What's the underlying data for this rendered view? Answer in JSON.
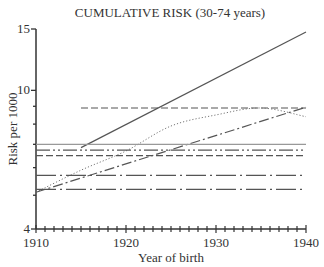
{
  "chart_data": {
    "type": "line",
    "title": "CUMULATIVE RISK (30-74 years)",
    "xlabel": "Year of birth",
    "ylabel": "Risk per 1000",
    "xlim": [
      1910,
      1940
    ],
    "ylim": [
      4,
      15
    ],
    "yscale": "log",
    "x_ticks": [
      1910,
      1920,
      1930,
      1940
    ],
    "y_ticks": [
      4,
      10,
      15
    ],
    "y_minor_ticks": [
      5,
      6,
      7,
      8,
      9
    ],
    "grid": false,
    "legend": null,
    "series": [
      {
        "name": "solid diagonal",
        "style": "solid",
        "x": [
          1915,
          1940
        ],
        "values": [
          6.85,
          14.7
        ]
      },
      {
        "name": "dashed horizontal (upper)",
        "style": "dashed",
        "x": [
          1915,
          1940
        ],
        "values": [
          8.9,
          8.9
        ]
      },
      {
        "name": "dotted curve",
        "style": "dotted",
        "x": [
          1910,
          1915,
          1920,
          1925,
          1930,
          1935,
          1940
        ],
        "values": [
          5.1,
          5.9,
          6.7,
          7.9,
          8.5,
          8.9,
          8.4
        ]
      },
      {
        "name": "dash-dot diagonal",
        "style": "dashdot",
        "x": [
          1910,
          1940
        ],
        "values": [
          5.1,
          8.95
        ]
      },
      {
        "name": "solid horizontal",
        "style": "solid",
        "x": [
          1910,
          1940
        ],
        "values": [
          7.0,
          7.0
        ]
      },
      {
        "name": "dash-dot-dot horizontal",
        "style": "dashdotdot",
        "x": [
          1910,
          1940
        ],
        "values": [
          6.74,
          6.74
        ]
      },
      {
        "name": "dashed horizontal (lower)",
        "style": "dashed",
        "x": [
          1910,
          1940
        ],
        "values": [
          6.5,
          6.5
        ]
      },
      {
        "name": "long-dash-dot horizontal (upper)",
        "style": "longdashdot",
        "x": [
          1910,
          1940
        ],
        "values": [
          5.7,
          5.7
        ]
      },
      {
        "name": "long-dash-dot horizontal (lower)",
        "style": "longdashdot",
        "x": [
          1910,
          1940
        ],
        "values": [
          5.2,
          5.2
        ]
      }
    ]
  }
}
